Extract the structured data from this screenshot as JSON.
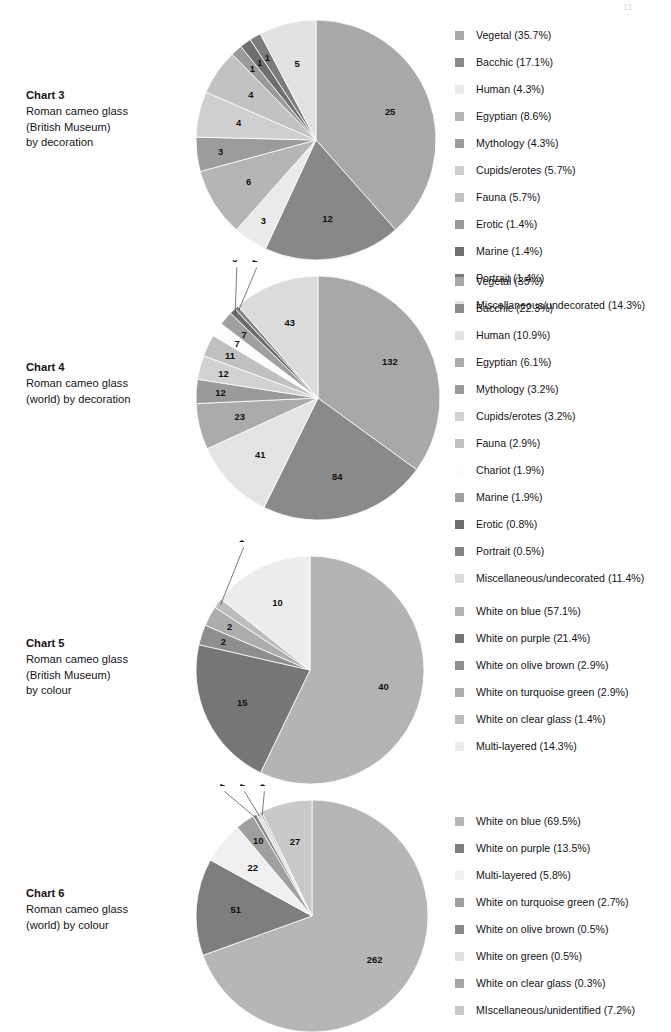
{
  "page": {
    "number": "11"
  },
  "charts": [
    {
      "id": "chart-3",
      "title": "Chart 3",
      "subtitle_lines": [
        "Roman cameo glass",
        "(British Museum)",
        "by decoration"
      ],
      "chart_data": {
        "type": "pie",
        "title": "Chart 3 — Roman cameo glass (British Museum) by decoration",
        "total": 70,
        "legend_position": "right",
        "categories": [
          "Vegetal",
          "Bacchic",
          "Human",
          "Egyptian",
          "Mythology",
          "Cupids/erotes",
          "Fauna",
          "Erotic",
          "Marine",
          "Portrait",
          "Miscellaneous/undecorated"
        ],
        "values": [
          25,
          12,
          3,
          6,
          3,
          4,
          4,
          1,
          1,
          1,
          5
        ],
        "percents": [
          35.7,
          17.1,
          4.3,
          8.6,
          4.3,
          5.7,
          5.7,
          1.4,
          1.4,
          1.4,
          14.3
        ],
        "colors": [
          "#a8a8a8",
          "#888888",
          "#ebebeb",
          "#b5b5b5",
          "#9c9c9c",
          "#cfcfcf",
          "#c2c2c2",
          "#9a9a9a",
          "#6e6e6e",
          "#7c7c7c",
          "#e2e2e2"
        ],
        "legend": [
          "Vegetal (35.7%)",
          "Bacchic (17.1%)",
          "Human (4.3%)",
          "Egyptian (8.6%)",
          "Mythology (4.3%)",
          "Cupids/erotes (5.7%)",
          "Fauna (5.7%)",
          "Erotic (1.4%)",
          "Marine (1.4%)",
          "Portrait (1.4%)",
          "Miscellaneous/undecorated (14.3%)"
        ],
        "slice_labels": [
          "25",
          "12",
          "3",
          "6",
          "3",
          "4",
          "4",
          "1",
          "1",
          "1",
          "5"
        ]
      }
    },
    {
      "id": "chart-4",
      "title": "Chart 4",
      "subtitle_lines": [
        "Roman cameo glass",
        "(world) by decoration"
      ],
      "chart_data": {
        "type": "pie",
        "title": "Chart 4 — Roman cameo glass (world) by decoration",
        "total": 377,
        "legend_position": "right",
        "categories": [
          "Vegetal",
          "Bacchic",
          "Human",
          "Egyptian",
          "Mythology",
          "Cupids/erotes",
          "Fauna",
          "Chariot",
          "Marine",
          "Erotic",
          "Portrait",
          "Miscellaneous/undecorated"
        ],
        "values": [
          132,
          84,
          41,
          23,
          12,
          12,
          11,
          7,
          7,
          3,
          2,
          43
        ],
        "percents": [
          35.0,
          22.3,
          10.9,
          6.1,
          3.2,
          3.2,
          2.9,
          1.9,
          1.9,
          0.8,
          0.5,
          11.4
        ],
        "colors": [
          "#a8a8a8",
          "#8a8a8a",
          "#e4e4e4",
          "#ababab",
          "#9a9a9a",
          "#d2d2d2",
          "#c0c0c0",
          "#fdfdfd",
          "#a0a0a0",
          "#6c6c6c",
          "#848484",
          "#dcdcdc"
        ],
        "legend": [
          "Vegetal (35%)",
          "Bacchic (22.3%)",
          "Human (10.9%)",
          "Egyptian (6.1%)",
          "Mythology (3.2%)",
          "Cupids/erotes (3.2%)",
          "Fauna (2.9%)",
          "Chariot (1.9%)",
          "Marine (1.9%)",
          "Erotic (0.8%)",
          "Portrait (0.5%)",
          "Miscellaneous/undecorated (11.4%)"
        ],
        "slice_labels": [
          "132",
          "84",
          "41",
          "23",
          "12",
          "12",
          "11",
          "7",
          "7",
          "3",
          "2",
          "43"
        ]
      }
    },
    {
      "id": "chart-5",
      "title": "Chart 5",
      "subtitle_lines": [
        "Roman cameo glass",
        "(British Museum)",
        "by colour"
      ],
      "chart_data": {
        "type": "pie",
        "title": "Chart 5 — Roman cameo glass (British Museum) by colour",
        "total": 70,
        "legend_position": "right",
        "categories": [
          "White on blue",
          "White on purple",
          "White on olive brown",
          "White on turquoise green",
          "White on clear glass",
          "Multi-layered"
        ],
        "values": [
          40,
          15,
          2,
          2,
          1,
          10
        ],
        "percents": [
          57.1,
          21.4,
          2.9,
          2.9,
          1.4,
          14.3
        ],
        "colors": [
          "#b4b4b4",
          "#767676",
          "#8e8e8e",
          "#adadad",
          "#bdbdbd",
          "#ededed"
        ],
        "legend": [
          "White on blue (57.1%)",
          "White on purple (21.4%)",
          "White on olive brown (2.9%)",
          "White on turquoise green (2.9%)",
          "White on clear glass (1.4%)",
          "Multi-layered (14.3%)"
        ],
        "slice_labels": [
          "40",
          "15",
          "2",
          "2",
          "1",
          "10"
        ]
      }
    },
    {
      "id": "chart-6",
      "title": "Chart 6",
      "subtitle_lines": [
        "Roman cameo glass",
        "(world) by colour"
      ],
      "chart_data": {
        "type": "pie",
        "title": "Chart 6 — Roman cameo glass (world) by colour",
        "total": 377,
        "legend_position": "right",
        "categories": [
          "White on blue",
          "White on purple",
          "Multi-layered",
          "White on turquoise green",
          "White on olive brown",
          "White on green",
          "White on clear glass",
          "MIscellaneous/unidentified"
        ],
        "values": [
          262,
          51,
          22,
          10,
          2,
          2,
          1,
          27
        ],
        "percents": [
          69.5,
          13.5,
          5.8,
          2.7,
          0.5,
          0.5,
          0.3,
          7.2
        ],
        "colors": [
          "#b6b6b6",
          "#7e7e7e",
          "#f0f0f0",
          "#9f9f9f",
          "#8a8a8a",
          "#e0e0e0",
          "#a5a5a5",
          "#c9c9c9"
        ],
        "legend": [
          "White on blue (69.5%)",
          "White on purple (13.5%)",
          "Multi-layered (5.8%)",
          "White on turquoise green (2.7%)",
          "White on olive brown (0.5%)",
          "White on green (0.5%)",
          "White on clear glass (0.3%)",
          "MIscellaneous/unidentified (7.2%)"
        ],
        "slice_labels": [
          "262",
          "51",
          "22",
          "10",
          "2",
          "2",
          "1",
          "27"
        ]
      }
    }
  ],
  "layout": {
    "blocks": [
      {
        "top": 0,
        "label_top": 88,
        "pie_left": 196,
        "pie_top": 20,
        "pie_size": 240,
        "legend_left": 455,
        "legend_top": 22,
        "outside_label_indices": []
      },
      {
        "top": 260,
        "label_top": 360,
        "pie_left": 196,
        "pie_top": 276,
        "pie_size": 244,
        "legend_left": 455,
        "legend_top": 268,
        "outside_label_indices": [
          9,
          10
        ]
      },
      {
        "top": 530,
        "label_top": 636,
        "pie_left": 196,
        "pie_top": 556,
        "pie_size": 228,
        "legend_left": 455,
        "legend_top": 598,
        "outside_label_indices": [
          4
        ]
      },
      {
        "top": 770,
        "label_top": 886,
        "pie_left": 196,
        "pie_top": 800,
        "pie_size": 232,
        "legend_left": 455,
        "legend_top": 808,
        "outside_label_indices": [
          4,
          5,
          6
        ]
      }
    ]
  }
}
